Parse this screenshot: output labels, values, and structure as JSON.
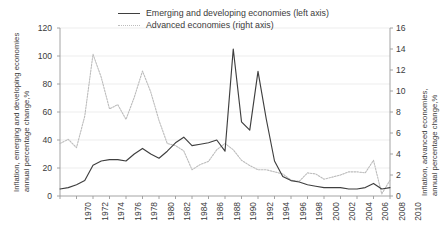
{
  "chart_data": {
    "type": "line",
    "title": "",
    "xlabel": "",
    "x": [
      1970,
      1971,
      1972,
      1973,
      1974,
      1975,
      1976,
      1977,
      1978,
      1979,
      1980,
      1981,
      1982,
      1983,
      1984,
      1985,
      1986,
      1987,
      1988,
      1989,
      1990,
      1991,
      1992,
      1993,
      1994,
      1995,
      1996,
      1997,
      1998,
      1999,
      2000,
      2001,
      2002,
      2003,
      2004,
      2005,
      2006,
      2007,
      2008,
      2009,
      2010
    ],
    "xlim": [
      1970,
      2010
    ],
    "xticks": [
      "1970",
      "1972",
      "1974",
      "1976",
      "1978",
      "1980",
      "1982",
      "1984",
      "1986",
      "1988",
      "1990",
      "1992",
      "1994",
      "1996",
      "1998",
      "2000",
      "2002",
      "2004",
      "2006",
      "2008",
      "2010"
    ],
    "grid": true,
    "legend_position": "top-center",
    "series": [
      {
        "name": "Emerging and developing economies (left axis)",
        "axis": "left",
        "style": "solid",
        "color": "#3f3f3f",
        "ylabel": "Inflation, emerging and developing economies, annual percentage change,%",
        "ylim": [
          0,
          120
        ],
        "yticks": [
          0,
          20,
          40,
          60,
          80,
          100,
          120
        ],
        "values": [
          5,
          6,
          8,
          11,
          22,
          25,
          26,
          26,
          25,
          30,
          34,
          30,
          27,
          32,
          38,
          42,
          36,
          37,
          38,
          40,
          32,
          105,
          53,
          47,
          89,
          55,
          25,
          14,
          11,
          10,
          8,
          7,
          6,
          6,
          6,
          5,
          5,
          6,
          9,
          5,
          6
        ]
      },
      {
        "name": "Advanced economies (right axis)",
        "axis": "right",
        "style": "dotted",
        "color": "#bcbcbc",
        "ylabel": "Inflation, advanced economies, annual percentage change,%",
        "ylim": [
          0,
          16
        ],
        "yticks": [
          0,
          2,
          4,
          6,
          8,
          10,
          12,
          14,
          16
        ],
        "values": [
          5.0,
          5.4,
          4.6,
          7.6,
          13.5,
          11.3,
          8.3,
          8.7,
          7.3,
          9.4,
          11.9,
          9.9,
          7.2,
          5.0,
          4.8,
          4.3,
          2.5,
          3.0,
          3.3,
          4.4,
          5.0,
          4.4,
          3.4,
          2.9,
          2.5,
          2.5,
          2.3,
          2.1,
          1.5,
          1.4,
          2.2,
          2.1,
          1.6,
          1.8,
          2.0,
          2.3,
          2.3,
          2.2,
          3.4,
          0.2,
          1.5
        ]
      }
    ]
  }
}
